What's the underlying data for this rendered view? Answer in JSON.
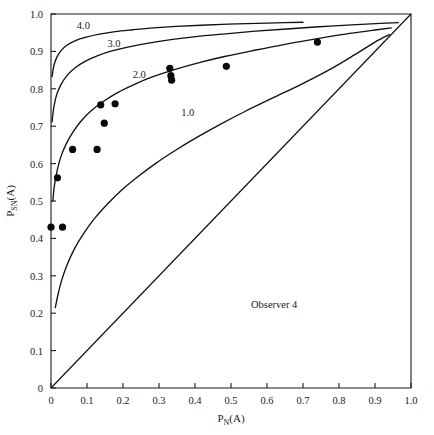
{
  "figure": {
    "background_color": "#ffffff",
    "ink_color": "#111111"
  },
  "chart_data": {
    "type": "scatter",
    "title": "",
    "subtitle": "",
    "xlabel": "P_N(A)",
    "xlabel_base": "P",
    "xlabel_sub": "N",
    "xlabel_tail": "(A)",
    "ylabel": "P_SN(A)",
    "ylabel_base": "P",
    "ylabel_sub": "SN",
    "ylabel_tail": "(A)",
    "xlim": [
      0,
      1
    ],
    "ylim": [
      0,
      1
    ],
    "grid": false,
    "legend": "none",
    "xticks": [
      0,
      0.1,
      0.2,
      0.3,
      0.4,
      0.5,
      0.6,
      0.7,
      0.8,
      0.9,
      1.0
    ],
    "xticklabels": [
      "0",
      "0.1",
      "0.2",
      "0.3",
      "0.4",
      "0.5",
      "0.6",
      "0.7",
      "0.8",
      "0.9",
      "1.0"
    ],
    "yticks": [
      0,
      0.1,
      0.2,
      0.3,
      0.4,
      0.5,
      0.6,
      0.7,
      0.8,
      0.9,
      1.0
    ],
    "yticklabels": [
      "0",
      "0.1",
      "0.2",
      "0.3",
      "0.4",
      "0.5",
      "0.6",
      "0.7",
      "0.8",
      "0.9",
      "1.0"
    ],
    "annotations": [
      {
        "text": "Observer 4",
        "x": 0.62,
        "y": 0.215
      }
    ],
    "points": [
      {
        "x": 0.0,
        "y": 0.43
      },
      {
        "x": 0.032,
        "y": 0.43
      },
      {
        "x": 0.018,
        "y": 0.562
      },
      {
        "x": 0.06,
        "y": 0.638
      },
      {
        "x": 0.128,
        "y": 0.638
      },
      {
        "x": 0.138,
        "y": 0.757
      },
      {
        "x": 0.148,
        "y": 0.708
      },
      {
        "x": 0.178,
        "y": 0.76
      },
      {
        "x": 0.33,
        "y": 0.855
      },
      {
        "x": 0.333,
        "y": 0.835
      },
      {
        "x": 0.335,
        "y": 0.823
      },
      {
        "x": 0.487,
        "y": 0.86
      },
      {
        "x": 0.74,
        "y": 0.925
      }
    ],
    "series": [
      {
        "name": "1.0",
        "label": "1.0",
        "label_x": 0.38,
        "label_y": 0.728,
        "dprime": 1.0,
        "points": [
          [
            0.012,
            0.215
          ],
          [
            0.02,
            0.252
          ],
          [
            0.03,
            0.289
          ],
          [
            0.045,
            0.33
          ],
          [
            0.065,
            0.372
          ],
          [
            0.09,
            0.412
          ],
          [
            0.12,
            0.452
          ],
          [
            0.155,
            0.49
          ],
          [
            0.195,
            0.528
          ],
          [
            0.24,
            0.564
          ],
          [
            0.29,
            0.6
          ],
          [
            0.345,
            0.635
          ],
          [
            0.405,
            0.67
          ],
          [
            0.47,
            0.705
          ],
          [
            0.54,
            0.74
          ],
          [
            0.615,
            0.775
          ],
          [
            0.695,
            0.812
          ],
          [
            0.775,
            0.852
          ],
          [
            0.845,
            0.892
          ],
          [
            0.9,
            0.925
          ],
          [
            0.94,
            0.945
          ]
        ]
      },
      {
        "name": "2.0",
        "label": "2.0",
        "label_x": 0.245,
        "label_y": 0.828,
        "dprime": 2.0,
        "points": [
          [
            0.005,
            0.5
          ],
          [
            0.01,
            0.545
          ],
          [
            0.018,
            0.585
          ],
          [
            0.028,
            0.62
          ],
          [
            0.042,
            0.652
          ],
          [
            0.06,
            0.683
          ],
          [
            0.082,
            0.712
          ],
          [
            0.11,
            0.74
          ],
          [
            0.145,
            0.766
          ],
          [
            0.185,
            0.79
          ],
          [
            0.232,
            0.812
          ],
          [
            0.285,
            0.833
          ],
          [
            0.345,
            0.852
          ],
          [
            0.412,
            0.87
          ],
          [
            0.485,
            0.887
          ],
          [
            0.565,
            0.903
          ],
          [
            0.65,
            0.919
          ],
          [
            0.74,
            0.934
          ],
          [
            0.83,
            0.948
          ],
          [
            0.905,
            0.958
          ],
          [
            0.945,
            0.963
          ]
        ]
      },
      {
        "name": "3.0",
        "label": "3.0",
        "label_x": 0.175,
        "label_y": 0.912,
        "dprime": 3.0,
        "points": [
          [
            0.003,
            0.712
          ],
          [
            0.008,
            0.752
          ],
          [
            0.016,
            0.785
          ],
          [
            0.028,
            0.812
          ],
          [
            0.045,
            0.836
          ],
          [
            0.068,
            0.857
          ],
          [
            0.096,
            0.874
          ],
          [
            0.13,
            0.889
          ],
          [
            0.172,
            0.902
          ],
          [
            0.22,
            0.913
          ],
          [
            0.275,
            0.923
          ],
          [
            0.338,
            0.932
          ],
          [
            0.408,
            0.94
          ],
          [
            0.485,
            0.947
          ],
          [
            0.568,
            0.954
          ],
          [
            0.655,
            0.96
          ],
          [
            0.745,
            0.966
          ],
          [
            0.835,
            0.971
          ],
          [
            0.915,
            0.975
          ],
          [
            0.965,
            0.977
          ]
        ]
      },
      {
        "name": "4.0",
        "label": "4.0",
        "label_x": 0.09,
        "label_y": 0.96,
        "dprime": 4.0,
        "points": [
          [
            0.003,
            0.833
          ],
          [
            0.008,
            0.862
          ],
          [
            0.016,
            0.884
          ],
          [
            0.028,
            0.902
          ],
          [
            0.045,
            0.917
          ],
          [
            0.068,
            0.929
          ],
          [
            0.098,
            0.938
          ],
          [
            0.134,
            0.946
          ],
          [
            0.178,
            0.953
          ],
          [
            0.228,
            0.958
          ],
          [
            0.285,
            0.963
          ],
          [
            0.348,
            0.967
          ],
          [
            0.418,
            0.97
          ],
          [
            0.492,
            0.973
          ],
          [
            0.57,
            0.975
          ],
          [
            0.65,
            0.977
          ],
          [
            0.7,
            0.978
          ]
        ]
      },
      {
        "name": "chance",
        "label": "",
        "dprime": 0,
        "points": [
          [
            0,
            0
          ],
          [
            1,
            1
          ]
        ]
      }
    ]
  }
}
